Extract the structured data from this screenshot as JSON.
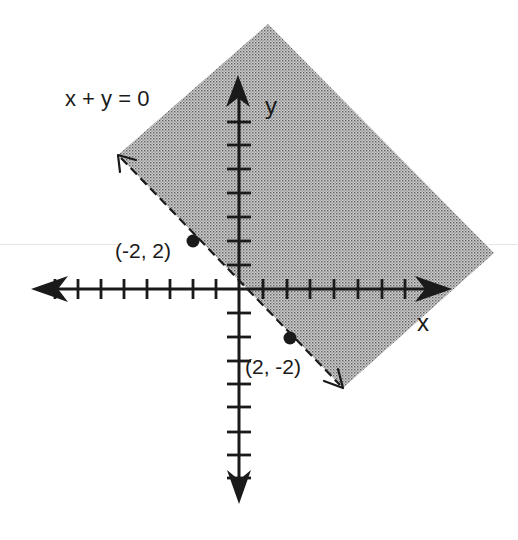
{
  "figure": {
    "equation_label": "x + y = 0",
    "x_axis_label": "x",
    "y_axis_label": "y",
    "boundary_style": "dashed",
    "shaded_side": "above-right of line x + y = 0"
  },
  "points": [
    {
      "label": "(-2, 2)",
      "x": -2,
      "y": 2
    },
    {
      "label": "(2, -2)",
      "x": 2,
      "y": -2
    }
  ],
  "axes": {
    "x_ticks_negative": 8,
    "x_ticks_positive": 7,
    "y_ticks_positive": 7,
    "y_ticks_negative": 8
  },
  "colors": {
    "shade_base": "#c8c8c8",
    "shade_dot": "#6a6a6a",
    "ink": "#1a1a1a"
  }
}
